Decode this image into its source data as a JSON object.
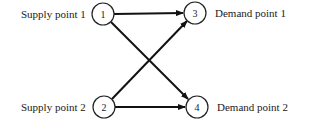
{
  "diagram": {
    "type": "transportation-network",
    "nodes": [
      {
        "id": "1",
        "label": "1",
        "caption": "Supply point 1",
        "x": 103,
        "y": 14
      },
      {
        "id": "2",
        "label": "2",
        "caption": "Supply point 2",
        "x": 104,
        "y": 107
      },
      {
        "id": "3",
        "label": "3",
        "caption": "Demand point 1",
        "x": 195,
        "y": 13
      },
      {
        "id": "4",
        "label": "4",
        "caption": "Demand point 2",
        "x": 197,
        "y": 107
      }
    ],
    "edges": [
      {
        "from": "1",
        "to": "3"
      },
      {
        "from": "1",
        "to": "4"
      },
      {
        "from": "2",
        "to": "3"
      },
      {
        "from": "2",
        "to": "4"
      }
    ]
  }
}
